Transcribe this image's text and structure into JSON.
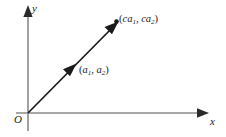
{
  "figure": {
    "name": "scalar-multiple-of-vector-diagram",
    "background_color": "#ffffff",
    "axis_color": "#808080",
    "vector_color": "#1a1a1a",
    "text_color": "#1a1a1a",
    "axes": {
      "x_label": "x",
      "y_label": "y",
      "origin_label": "O",
      "x_axis": {
        "x1": 16,
        "y1": 113,
        "x2": 206,
        "y2": 113
      },
      "y_axis": {
        "x1": 28,
        "y1": 130,
        "x2": 28,
        "y2": 12
      }
    },
    "vector": {
      "start": {
        "x": 28,
        "y": 113
      },
      "end": {
        "x": 117,
        "y": 23
      },
      "mid_arrow_at": {
        "x": 72,
        "y": 68
      },
      "endpoint_dot": {
        "x": 116,
        "y": 21,
        "r": 2.2
      }
    },
    "labels": [
      {
        "name": "point-label-a",
        "open": "(",
        "var1": "a",
        "sub1": "1",
        "sep": ", ",
        "var2": "a",
        "sub2": "2",
        "close": ")",
        "text": "(a1, a2)"
      },
      {
        "name": "point-label-ca",
        "open": "(",
        "var1": "ca",
        "sub1": "1",
        "sep": ", ",
        "var2": "ca",
        "sub2": "2",
        "close": ")",
        "text": "(ca1, ca2)"
      }
    ]
  }
}
